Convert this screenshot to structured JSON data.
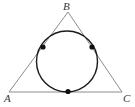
{
  "figure": {
    "background_color": "#ffffff",
    "width": 135,
    "height": 107,
    "triangle": {
      "name": "triangle-ABC",
      "stroke_color": "#8c8c8c",
      "stroke_width": 1,
      "fill": "none",
      "vertices": [
        {
          "label": "A",
          "x": 9,
          "y": 92
        },
        {
          "label": "B",
          "x": 68,
          "y": 12
        },
        {
          "label": "C",
          "x": 122,
          "y": 92
        }
      ],
      "points_path": "9,92 68,12 122,92"
    },
    "incircle": {
      "name": "inscribed-circle",
      "stroke_color": "#1a1a1a",
      "stroke_width": 1.4,
      "fill": "none",
      "center_x": 67,
      "center_y": 61.5,
      "radius": 30.5
    },
    "tangent_points": [
      {
        "label": "tangent-point-AB",
        "x": 43,
        "y": 47,
        "radius": 2.6,
        "color": "#111111"
      },
      {
        "label": "tangent-point-BC",
        "x": 92,
        "y": 47,
        "radius": 2.6,
        "color": "#111111"
      },
      {
        "label": "tangent-point-AC",
        "x": 68,
        "y": 91.5,
        "radius": 2.6,
        "color": "#111111"
      }
    ],
    "labels": {
      "vertex_a": "A",
      "vertex_b": "B",
      "vertex_c": "C"
    }
  }
}
